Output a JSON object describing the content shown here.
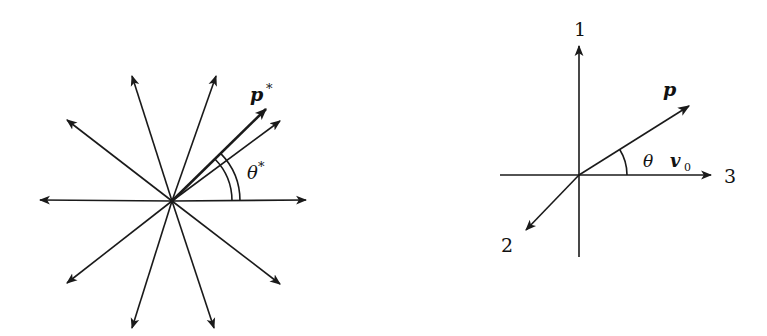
{
  "left_diagram": {
    "title": "isotropic emission in rest frame",
    "center": [
      172,
      201
    ],
    "arrow_tips": [
      [
        306,
        200
      ],
      [
        40,
        200
      ],
      [
        216,
        76
      ],
      [
        132,
        76
      ],
      [
        67,
        120
      ],
      [
        280,
        284
      ],
      [
        67,
        283
      ],
      [
        132,
        328
      ],
      [
        214,
        328
      ],
      [
        280,
        121
      ]
    ],
    "highlighted_arrow_tip": [
      266,
      109
    ],
    "arc_radii": [
      60,
      68
    ],
    "labels": {
      "momentum": "p",
      "momentum_superscript": "*",
      "angle": "θ",
      "angle_superscript": "*"
    }
  },
  "right_diagram": {
    "title": "lab frame axes",
    "origin": [
      579,
      175
    ],
    "axis_labels": {
      "axis1": "1",
      "axis2": "2",
      "axis3": "3"
    },
    "vectors": {
      "momentum_label": "p",
      "velocity_label": "v",
      "velocity_subscript": "0",
      "angle_label": "θ"
    },
    "arc_radius": 48
  },
  "colors": {
    "ink": "#1a1a1a",
    "background": "#ffffff"
  }
}
